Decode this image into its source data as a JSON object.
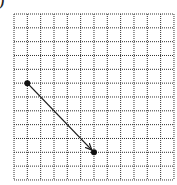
{
  "figure": {
    "label": ")",
    "grid": {
      "columns": 12,
      "rows": 12,
      "left": 14,
      "top": 14,
      "cell_w": 13.33,
      "cell_h": 13.83,
      "line_color": "#333333",
      "line_style": "dotted"
    },
    "vector": {
      "start": {
        "col": 1,
        "row": 5
      },
      "end": {
        "col": 6,
        "row": 10
      },
      "color": "#1a1a1a",
      "has_arrowhead": true
    },
    "points": [
      {
        "name": "start-point",
        "col": 1,
        "row": 5
      },
      {
        "name": "end-point",
        "col": 6,
        "row": 10
      }
    ]
  }
}
